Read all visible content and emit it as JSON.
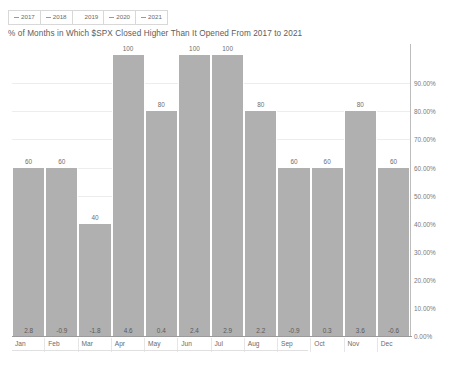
{
  "legend": {
    "items": [
      {
        "label": "2017",
        "marker": "dash"
      },
      {
        "label": "2018",
        "marker": "dash"
      },
      {
        "label": "2019",
        "marker": "none"
      },
      {
        "label": "2020",
        "marker": "dash"
      },
      {
        "label": "2021",
        "marker": "dash"
      }
    ]
  },
  "chart_data": {
    "type": "bar",
    "title": "% of Months in Which $SPX Closed Higher Than It Opened From 2017 to 2021",
    "xlabel": "",
    "ylabel": "",
    "categories": [
      "Jan",
      "Feb",
      "Mar",
      "Apr",
      "May",
      "Jun",
      "Jul",
      "Aug",
      "Sep",
      "Oct",
      "Nov",
      "Dec"
    ],
    "values": [
      60,
      60,
      40,
      100,
      80,
      100,
      100,
      80,
      60,
      60,
      80,
      60
    ],
    "value_labels": [
      "60",
      "60",
      "40",
      "100",
      "80",
      "100",
      "100",
      "80",
      "60",
      "60",
      "80",
      "60"
    ],
    "inner_labels": [
      "2.8",
      "-0.9",
      "-1.8",
      "4.6",
      "0.4",
      "2.4",
      "2.9",
      "2.2",
      "-0.9",
      "0.3",
      "3.6",
      "-0.6"
    ],
    "ylim": [
      0,
      104
    ],
    "ytick_values": [
      0,
      10,
      20,
      30,
      40,
      50,
      60,
      70,
      80,
      90
    ],
    "ytick_labels": [
      "0.00%",
      "10.00%",
      "20.00%",
      "30.00%",
      "40.00%",
      "50.00%",
      "60.00%",
      "70.00%",
      "80.00%",
      "90.00%"
    ],
    "grid": true,
    "legend_position": "top-left",
    "bar_color": "#b0b0b0",
    "axis_color": "#9a9a9a",
    "grid_color": "#ededed",
    "text_color": "#6b6b6b"
  },
  "footer": {
    "ghost_text": ""
  }
}
